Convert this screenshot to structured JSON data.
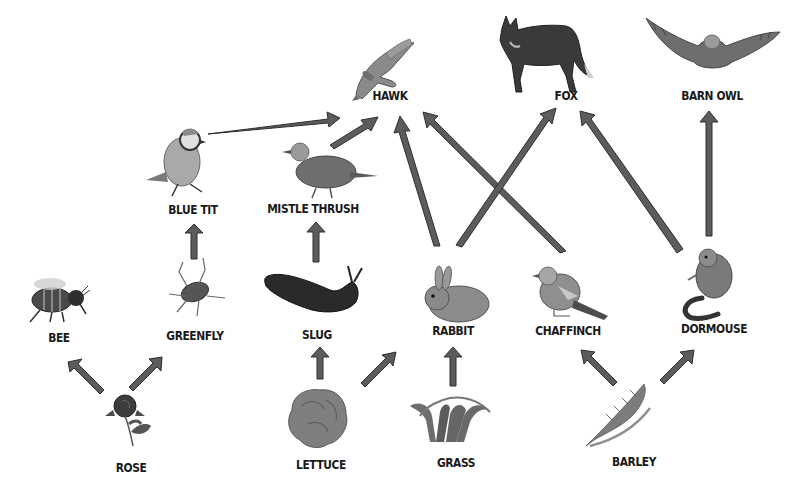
{
  "diagram": {
    "type": "food web",
    "colors": {
      "arrow_fill": "#5a5a5a",
      "arrow_stroke": "#2e2e2e",
      "label_text": "#1a1a1a",
      "background": "#ffffff"
    },
    "organisms": [
      {
        "id": "hawk",
        "label": "HAWK",
        "icon": "hawk-icon",
        "x": 390,
        "y": 96
      },
      {
        "id": "fox",
        "label": "FOX",
        "icon": "fox-icon",
        "x": 566,
        "y": 96
      },
      {
        "id": "barn_owl",
        "label": "BARN OWL",
        "icon": "barn-owl-icon",
        "x": 712,
        "y": 96
      },
      {
        "id": "blue_tit",
        "label": "BLUE TIT",
        "icon": "blue-tit-icon",
        "x": 193,
        "y": 210
      },
      {
        "id": "mistle_thrush",
        "label": "MISTLE THRUSH",
        "icon": "mistle-thrush-icon",
        "x": 313,
        "y": 209
      },
      {
        "id": "bee",
        "label": "BEE",
        "icon": "bee-icon",
        "x": 59,
        "y": 338
      },
      {
        "id": "greenfly",
        "label": "GREENFLY",
        "icon": "greenfly-icon",
        "x": 195,
        "y": 336
      },
      {
        "id": "slug",
        "label": "SLUG",
        "icon": "slug-icon",
        "x": 317,
        "y": 335
      },
      {
        "id": "rabbit",
        "label": "RABBIT",
        "icon": "rabbit-icon",
        "x": 453,
        "y": 331
      },
      {
        "id": "chaffinch",
        "label": "CHAFFINCH",
        "icon": "chaffinch-icon",
        "x": 568,
        "y": 331
      },
      {
        "id": "dormouse",
        "label": "DORMOUSE",
        "icon": "dormouse-icon",
        "x": 714,
        "y": 329
      },
      {
        "id": "rose",
        "label": "ROSE",
        "icon": "rose-icon",
        "x": 131,
        "y": 468
      },
      {
        "id": "lettuce",
        "label": "LETTUCE",
        "icon": "lettuce-icon",
        "x": 321,
        "y": 465
      },
      {
        "id": "grass",
        "label": "GRASS",
        "icon": "grass-icon",
        "x": 456,
        "y": 463
      },
      {
        "id": "barley",
        "label": "BARLEY",
        "icon": "barley-icon",
        "x": 634,
        "y": 462
      }
    ],
    "links": [
      {
        "from": "rose",
        "to": "bee"
      },
      {
        "from": "rose",
        "to": "greenfly"
      },
      {
        "from": "greenfly",
        "to": "blue_tit"
      },
      {
        "from": "blue_tit",
        "to": "hawk"
      },
      {
        "from": "lettuce",
        "to": "slug"
      },
      {
        "from": "lettuce",
        "to": "rabbit"
      },
      {
        "from": "slug",
        "to": "mistle_thrush"
      },
      {
        "from": "mistle_thrush",
        "to": "hawk"
      },
      {
        "from": "grass",
        "to": "rabbit"
      },
      {
        "from": "rabbit",
        "to": "hawk"
      },
      {
        "from": "rabbit",
        "to": "fox"
      },
      {
        "from": "barley",
        "to": "chaffinch"
      },
      {
        "from": "barley",
        "to": "dormouse"
      },
      {
        "from": "chaffinch",
        "to": "hawk"
      },
      {
        "from": "dormouse",
        "to": "fox"
      },
      {
        "from": "dormouse",
        "to": "barn_owl"
      }
    ]
  }
}
